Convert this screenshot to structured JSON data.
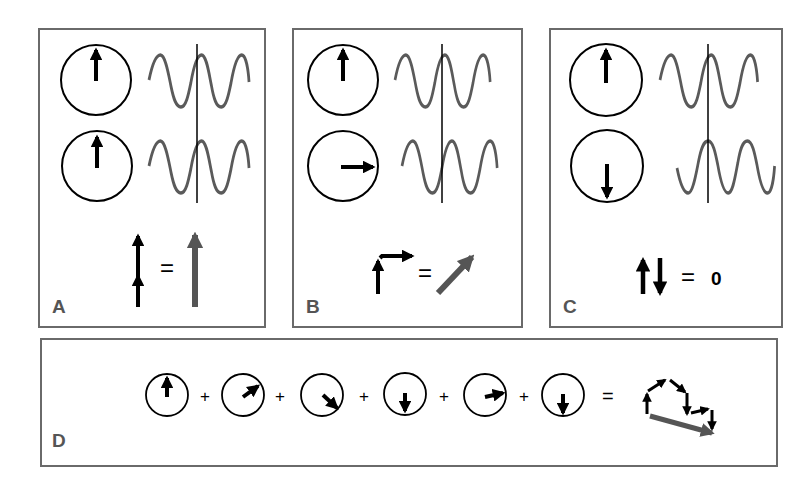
{
  "figure": {
    "panels": [
      {
        "id": "A",
        "label": "A",
        "title": "In-phase (constructive) addition",
        "top_phasor": "up",
        "bottom_phasor": "up",
        "equation": {
          "lhs": "two up arrows stacked",
          "operator": "=",
          "result": "long up arrow"
        }
      },
      {
        "id": "B",
        "label": "B",
        "title": "90 degree phase difference",
        "top_phasor": "up",
        "bottom_phasor": "right",
        "equation": {
          "lhs": "up arrow + right arrow",
          "operator": "=",
          "result": "diagonal arrow"
        }
      },
      {
        "id": "C",
        "label": "C",
        "title": "180 degree phase difference (cancellation)",
        "top_phasor": "up",
        "bottom_phasor": "down",
        "equation": {
          "lhs": "up and down arrows",
          "operator": "=",
          "result": "0"
        }
      }
    ],
    "panel_d": {
      "label": "D",
      "phasors": [
        "up",
        "up-right",
        "down-right",
        "down",
        "right",
        "down"
      ],
      "plus_sign": "+",
      "equals_sign": "=",
      "result": "vector sum (head-to-tail chain with resultant)"
    },
    "colors": {
      "border": "#6a6a6a",
      "wave": "#5a5a5a",
      "arrow": "#000000",
      "resultant": "#555555",
      "label": "#555555"
    }
  }
}
